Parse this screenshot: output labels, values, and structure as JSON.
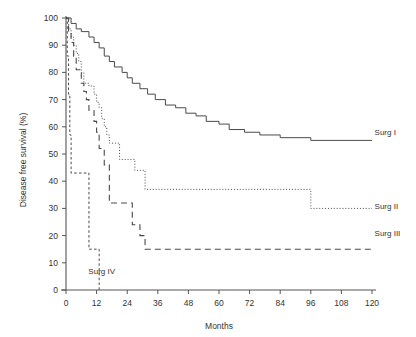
{
  "chart_data": {
    "type": "line",
    "title": "",
    "subtitle": "",
    "xlabel": "Months",
    "ylabel": "Disease free survival (%)",
    "xlim": [
      0,
      120
    ],
    "ylim": [
      0,
      100
    ],
    "grid": false,
    "legend_position": "inline-right",
    "xticks": [
      "0",
      "12",
      "24",
      "36",
      "48",
      "60",
      "72",
      "84",
      "96",
      "108",
      "120"
    ],
    "yticks": [
      "0",
      "10",
      "20",
      "30",
      "40",
      "50",
      "60",
      "70",
      "80",
      "90",
      "100"
    ],
    "annotations": [
      "Surg IV"
    ],
    "series": [
      {
        "name": "Surg I",
        "style": "solid",
        "label": "Surg I",
        "label_x": 121,
        "label_y": 58,
        "points": [
          [
            0,
            100
          ],
          [
            2,
            100
          ],
          [
            2,
            98
          ],
          [
            4,
            98
          ],
          [
            4,
            96
          ],
          [
            6,
            96
          ],
          [
            6,
            95
          ],
          [
            9,
            95
          ],
          [
            9,
            93
          ],
          [
            11,
            93
          ],
          [
            11,
            91
          ],
          [
            13,
            91
          ],
          [
            13,
            89
          ],
          [
            15,
            89
          ],
          [
            15,
            86
          ],
          [
            17,
            86
          ],
          [
            17,
            84
          ],
          [
            19,
            84
          ],
          [
            19,
            82
          ],
          [
            22,
            82
          ],
          [
            22,
            80
          ],
          [
            24,
            80
          ],
          [
            24,
            78
          ],
          [
            26,
            78
          ],
          [
            26,
            76
          ],
          [
            29,
            76
          ],
          [
            29,
            74
          ],
          [
            32,
            74
          ],
          [
            32,
            72
          ],
          [
            35,
            72
          ],
          [
            35,
            70
          ],
          [
            39,
            70
          ],
          [
            39,
            68
          ],
          [
            43,
            68
          ],
          [
            43,
            67
          ],
          [
            47,
            67
          ],
          [
            47,
            65
          ],
          [
            51,
            65
          ],
          [
            51,
            64
          ],
          [
            55,
            64
          ],
          [
            55,
            62
          ],
          [
            60,
            62
          ],
          [
            60,
            61
          ],
          [
            64,
            61
          ],
          [
            64,
            59
          ],
          [
            70,
            59
          ],
          [
            70,
            58
          ],
          [
            76,
            58
          ],
          [
            76,
            57
          ],
          [
            84,
            57
          ],
          [
            84,
            56
          ],
          [
            96,
            56
          ],
          [
            96,
            55
          ],
          [
            120,
            55
          ]
        ]
      },
      {
        "name": "Surg II",
        "style": "dotted",
        "label": "Surg II",
        "label_x": 121,
        "label_y": 31,
        "points": [
          [
            0,
            100
          ],
          [
            1,
            100
          ],
          [
            1,
            96
          ],
          [
            2,
            96
          ],
          [
            2,
            93
          ],
          [
            3,
            93
          ],
          [
            3,
            90
          ],
          [
            4,
            90
          ],
          [
            4,
            87
          ],
          [
            5,
            87
          ],
          [
            5,
            84
          ],
          [
            6,
            84
          ],
          [
            6,
            80
          ],
          [
            7,
            80
          ],
          [
            7,
            76
          ],
          [
            9,
            76
          ],
          [
            9,
            75
          ],
          [
            11,
            75
          ],
          [
            11,
            72
          ],
          [
            12,
            72
          ],
          [
            12,
            69
          ],
          [
            13,
            69
          ],
          [
            13,
            67
          ],
          [
            14,
            67
          ],
          [
            14,
            63
          ],
          [
            15,
            63
          ],
          [
            15,
            60
          ],
          [
            16,
            60
          ],
          [
            16,
            57
          ],
          [
            17,
            57
          ],
          [
            17,
            54
          ],
          [
            21,
            54
          ],
          [
            21,
            48
          ],
          [
            27,
            48
          ],
          [
            27,
            44
          ],
          [
            31,
            44
          ],
          [
            31,
            37
          ],
          [
            96,
            37
          ],
          [
            96,
            30
          ],
          [
            120,
            30
          ]
        ]
      },
      {
        "name": "Surg III",
        "style": "dashed",
        "label": "Surg III",
        "label_x": 121,
        "label_y": 21,
        "points": [
          [
            0,
            100
          ],
          [
            1,
            100
          ],
          [
            1,
            95
          ],
          [
            2,
            95
          ],
          [
            2,
            91
          ],
          [
            3,
            91
          ],
          [
            3,
            86
          ],
          [
            4,
            86
          ],
          [
            4,
            81
          ],
          [
            6,
            81
          ],
          [
            6,
            76
          ],
          [
            7,
            76
          ],
          [
            7,
            73
          ],
          [
            8,
            73
          ],
          [
            8,
            70
          ],
          [
            9,
            70
          ],
          [
            9,
            66
          ],
          [
            11,
            66
          ],
          [
            11,
            62
          ],
          [
            12,
            62
          ],
          [
            12,
            58
          ],
          [
            13,
            58
          ],
          [
            13,
            52
          ],
          [
            15,
            52
          ],
          [
            15,
            46
          ],
          [
            17,
            46
          ],
          [
            17,
            32
          ],
          [
            26,
            32
          ],
          [
            26,
            24
          ],
          [
            29,
            24
          ],
          [
            29,
            20
          ],
          [
            31,
            20
          ],
          [
            31,
            15
          ],
          [
            120,
            15
          ]
        ]
      },
      {
        "name": "Surg IV",
        "style": "shortdash",
        "label": "Surg IV",
        "label_x": 14,
        "label_y": 7,
        "points": [
          [
            0,
            100
          ],
          [
            0.5,
            100
          ],
          [
            0.5,
            86
          ],
          [
            1,
            86
          ],
          [
            1,
            72
          ],
          [
            1.5,
            72
          ],
          [
            1.5,
            57
          ],
          [
            2,
            57
          ],
          [
            2,
            43
          ],
          [
            9,
            43
          ],
          [
            9,
            15
          ],
          [
            13,
            15
          ],
          [
            13,
            0
          ]
        ]
      }
    ]
  }
}
